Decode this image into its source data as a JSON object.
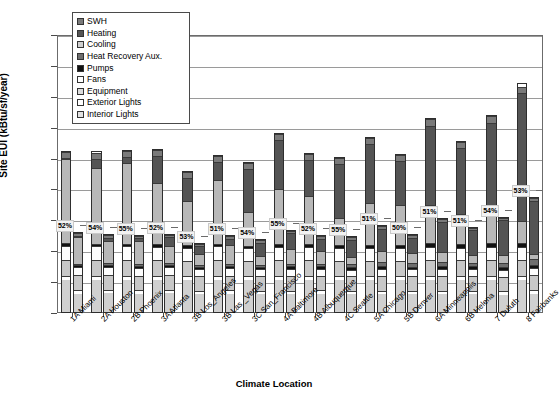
{
  "chart_data": {
    "type": "bar",
    "subtype": "stacked-grouped",
    "title": "",
    "xlabel": "Climate Location",
    "ylabel": "Site EUI (kBtu/sf/year)",
    "ylim": [
      0,
      90
    ],
    "ytick_step": 10,
    "yticks": [
      0,
      10,
      20,
      30,
      40,
      50,
      60,
      70,
      80,
      90
    ],
    "grid": true,
    "legend_position": "top-left-inside",
    "bars_per_category": 2,
    "bar_names": [
      "Baseline",
      "Low Energy"
    ],
    "categories": [
      "1A Miami",
      "2A Houston",
      "2B Phoenix",
      "3A Atlanta",
      "3B Los_Angeles",
      "3B Las _Vegas",
      "3C San_Francisco",
      "4A Baltimore",
      "4B Albuquerque",
      "4C Seattle",
      "5A Chicago",
      "5B Denver",
      "6A Minneapolis",
      "6B Helena",
      "7 Duluth",
      "8 Fairbanks"
    ],
    "series": [
      {
        "name": "Interior Lights",
        "swatch": "light-gray",
        "color": "#d0d0d0",
        "baseline": [
          10.5,
          10.5,
          10.5,
          10.5,
          10.5,
          10.5,
          10.5,
          10.5,
          10.5,
          10.5,
          10.5,
          10.5,
          10.5,
          10.5,
          10.5,
          10.5
        ],
        "lowenergy": [
          6.2,
          6.2,
          6.2,
          6.2,
          6.2,
          6.2,
          6.2,
          6.2,
          6.2,
          6.2,
          6.2,
          6.2,
          6.2,
          6.2,
          6.2,
          6.2
        ]
      },
      {
        "name": "Exterior Lights",
        "swatch": "white",
        "color": "#ffffff",
        "baseline": [
          1.4,
          1.4,
          1.4,
          1.4,
          1.4,
          1.4,
          1.4,
          1.4,
          1.4,
          1.4,
          1.4,
          1.4,
          1.4,
          1.4,
          1.4,
          1.4
        ],
        "lowenergy": [
          1.2,
          1.2,
          1.2,
          1.2,
          1.2,
          1.2,
          1.2,
          1.2,
          1.2,
          1.2,
          1.2,
          1.2,
          1.2,
          1.2,
          1.2,
          1.2
        ]
      },
      {
        "name": "Equipment",
        "swatch": "light-gray",
        "color": "#c8c8c8",
        "baseline": [
          5.0,
          5.0,
          5.0,
          5.0,
          5.0,
          5.0,
          5.0,
          5.0,
          5.0,
          5.0,
          5.0,
          5.0,
          5.0,
          5.0,
          5.0,
          5.0
        ],
        "lowenergy": [
          5.0,
          5.0,
          5.0,
          5.0,
          5.0,
          5.0,
          5.0,
          5.0,
          5.0,
          5.0,
          5.0,
          5.0,
          5.0,
          5.0,
          5.0,
          5.0
        ]
      },
      {
        "name": "Fans",
        "swatch": "white",
        "color": "#fdfdfd",
        "baseline": [
          4.8,
          4.6,
          4.6,
          4.4,
          4.2,
          4.6,
          4.0,
          4.4,
          4.4,
          4.0,
          4.4,
          4.4,
          4.4,
          4.2,
          4.4,
          4.4
        ],
        "lowenergy": [
          2.6,
          2.6,
          2.6,
          2.5,
          2.4,
          2.6,
          2.3,
          2.5,
          2.5,
          2.3,
          2.5,
          2.5,
          2.5,
          2.4,
          2.5,
          2.5
        ]
      },
      {
        "name": "Pumps",
        "swatch": "black",
        "color": "#111111",
        "baseline": [
          0.8,
          0.8,
          0.8,
          0.9,
          0.8,
          0.8,
          0.9,
          1.0,
          0.9,
          1.0,
          1.1,
          1.0,
          1.2,
          1.1,
          1.2,
          1.3
        ],
        "lowenergy": [
          0.7,
          0.7,
          0.7,
          0.8,
          0.7,
          0.7,
          0.8,
          0.9,
          0.8,
          0.9,
          1.0,
          0.9,
          1.0,
          1.0,
          1.1,
          1.1
        ]
      },
      {
        "name": "Heat Recovery Aux.",
        "swatch": "dark-gray",
        "color": "#6e6e6e",
        "baseline": [
          0.0,
          0.0,
          0.0,
          0.0,
          0.0,
          0.0,
          0.0,
          0.0,
          0.0,
          0.0,
          0.0,
          0.0,
          0.0,
          0.0,
          0.0,
          0.0
        ],
        "lowenergy": [
          0.6,
          0.7,
          0.7,
          0.8,
          0.6,
          0.7,
          0.8,
          1.0,
          0.8,
          1.0,
          1.2,
          1.1,
          1.4,
          1.3,
          1.5,
          1.8
        ]
      },
      {
        "name": "Cooling",
        "swatch": "light-gray",
        "color": "#b8b8b8",
        "baseline": [
          27.5,
          25.0,
          26.5,
          20.0,
          14.5,
          21.0,
          11.0,
          18.0,
          16.0,
          9.0,
          14.0,
          13.0,
          12.5,
          10.0,
          10.0,
          7.0
        ],
        "lowenergy": [
          9.0,
          7.5,
          8.0,
          5.5,
          4.0,
          6.5,
          3.0,
          5.0,
          4.5,
          2.5,
          4.0,
          3.5,
          3.5,
          2.8,
          2.8,
          2.0
        ]
      },
      {
        "name": "Heating",
        "swatch": "dark-gray",
        "color": "#545454",
        "baseline": [
          0.5,
          3.0,
          2.0,
          9.0,
          7.5,
          6.0,
          14.0,
          16.0,
          11.5,
          17.5,
          19.5,
          14.5,
          26.0,
          21.5,
          29.5,
          42.0
        ],
        "lowenergy": [
          0.3,
          1.0,
          0.8,
          3.0,
          2.5,
          2.0,
          4.5,
          5.5,
          4.0,
          6.0,
          7.5,
          5.5,
          10.5,
          8.5,
          12.5,
          18.0
        ]
      },
      {
        "name": "SWH",
        "swatch": "dark-gray",
        "color": "#7a7a7a",
        "baseline": [
          2.0,
          2.0,
          2.0,
          2.0,
          2.0,
          2.0,
          2.0,
          2.0,
          2.0,
          2.0,
          2.0,
          2.0,
          2.0,
          2.0,
          2.0,
          2.0
        ],
        "lowenergy": [
          0.9,
          0.9,
          0.9,
          0.9,
          0.9,
          0.9,
          0.9,
          0.9,
          0.9,
          0.9,
          0.9,
          0.9,
          0.9,
          0.9,
          0.9,
          0.9
        ]
      }
    ],
    "baseline_totals": [
      52.5,
      52.3,
      52.8,
      53.2,
      45.9,
      51.3,
      48.8,
      58.3,
      51.7,
      50.4,
      57.0,
      51.4,
      63.0,
      55.7,
      64.0,
      74.6
    ],
    "lowenergy_totals": [
      26.2,
      25.6,
      25.4,
      25.7,
      22.8,
      25.1,
      23.9,
      27.0,
      25.1,
      24.9,
      28.4,
      25.6,
      30.7,
      28.0,
      31.2,
      37.6
    ],
    "savings_labels": [
      "52%",
      "54%",
      "55%",
      "52%",
      "53%",
      "51%",
      "54%",
      "55%",
      "52%",
      "55%",
      "51%",
      "50%",
      "51%",
      "51%",
      "54%",
      "53%"
    ],
    "legend_entries": [
      "SWH",
      "Heating",
      "Cooling",
      "Heat Recovery Aux.",
      "Pumps",
      "Fans",
      "Equipment",
      "Exterior Lights",
      "Interior Lights"
    ]
  }
}
